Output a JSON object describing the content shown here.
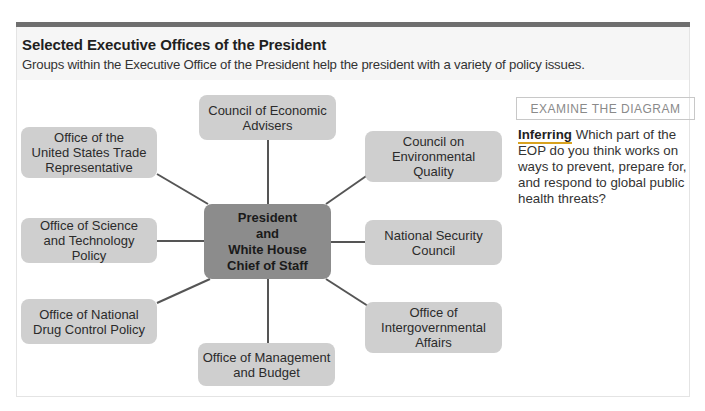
{
  "header": {
    "title": "Selected Executive Offices of the President",
    "subtitle": "Groups within the Executive Office of the President help the president with a variety of policy issues."
  },
  "diagram": {
    "center": {
      "label": "President\nand\nWhite House\nChief of Staff"
    },
    "nodes": [
      {
        "id": "cea",
        "label": "Council of Economic\nAdvisers"
      },
      {
        "id": "ceq",
        "label": "Council on\nEnvironmental\nQuality"
      },
      {
        "id": "nsc",
        "label": "National Security\nCouncil"
      },
      {
        "id": "oia",
        "label": "Office of\nIntergovernmental\nAffairs"
      },
      {
        "id": "omb",
        "label": "Office of Management\nand Budget"
      },
      {
        "id": "ondcp",
        "label": "Office of National\nDrug Control Policy"
      },
      {
        "id": "ostp",
        "label": "Office of Science\nand Technology Policy"
      },
      {
        "id": "ustr",
        "label": "Office of the\nUnited States Trade\nRepresentative"
      }
    ],
    "colors": {
      "node_fill": "#cfcfcf",
      "center_fill": "#8c8c8c",
      "line": "#555555"
    }
  },
  "sidebar": {
    "heading": "EXAMINE THE DIAGRAM",
    "keyword": "Inferring",
    "question": " Which part of the EOP do you think works on ways to prevent, prepare for, and respond to global public health threats?"
  }
}
